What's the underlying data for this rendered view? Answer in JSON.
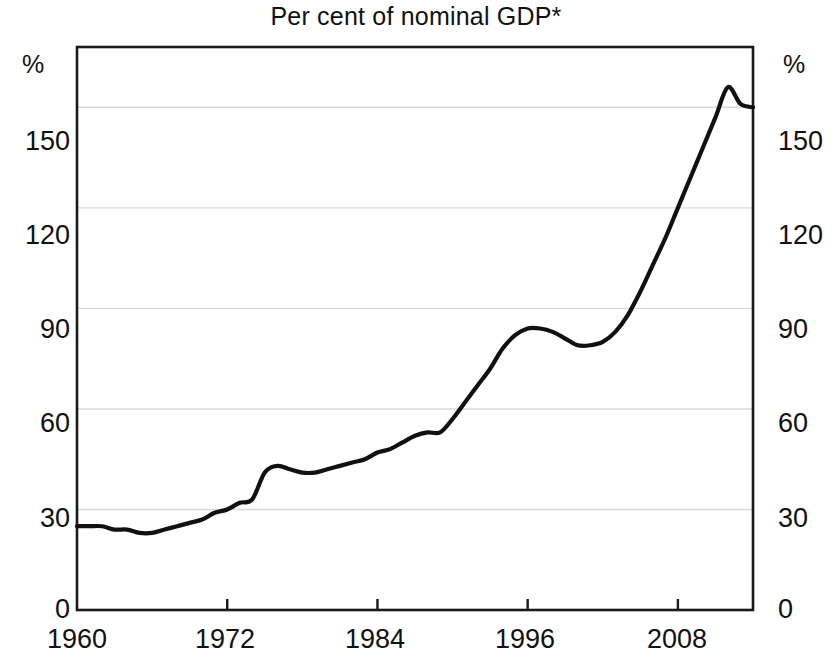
{
  "chart": {
    "title": "Per cent of nominal GDP*",
    "unit_left": "%",
    "unit_right": "%"
  },
  "axis": {
    "y_ticks": [
      "0",
      "30",
      "60",
      "90",
      "120",
      "150"
    ],
    "x_ticks": [
      "1960",
      "1972",
      "1984",
      "1996",
      "2008"
    ]
  },
  "chart_data": {
    "type": "line",
    "title": "Per cent of nominal GDP*",
    "subtitle": "",
    "xlabel": "",
    "ylabel": "%",
    "y_axis_unit": "%",
    "y_axis_unit_right": "%",
    "xlim": [
      1960,
      2014
    ],
    "ylim": [
      0,
      168
    ],
    "y_ticks": [
      0,
      30,
      60,
      90,
      120,
      150
    ],
    "x_ticks": [
      1960,
      1972,
      1984,
      1996,
      2008
    ],
    "grid": "horizontal",
    "legend": "none",
    "line_color": "#111111",
    "annotations": [
      "* asterisk in title denotes footnote"
    ],
    "series": [
      {
        "name": "Per cent of nominal GDP",
        "x": [
          1960,
          1961,
          1962,
          1963,
          1964,
          1965,
          1966,
          1967,
          1968,
          1969,
          1970,
          1971,
          1972,
          1973,
          1974,
          1975,
          1976,
          1977,
          1978,
          1979,
          1980,
          1981,
          1982,
          1983,
          1984,
          1985,
          1986,
          1987,
          1988,
          1989,
          1990,
          1991,
          1992,
          1993,
          1994,
          1995,
          1996,
          1997,
          1998,
          1999,
          2000,
          2001,
          2002,
          2003,
          2004,
          2005,
          2006,
          2007,
          2008,
          2009,
          2010,
          2011,
          2012,
          2013,
          2014
        ],
        "values": [
          25,
          25,
          25,
          24,
          24,
          23,
          23,
          24,
          25,
          26,
          27,
          29,
          30,
          32,
          33,
          41,
          43,
          42,
          41,
          41,
          42,
          43,
          44,
          45,
          47,
          48,
          50,
          52,
          53,
          53,
          57,
          62,
          67,
          72,
          78,
          82,
          84,
          84,
          83,
          81,
          79,
          79,
          80,
          83,
          88,
          95,
          103,
          111,
          120,
          129,
          138,
          147,
          156,
          151,
          150
        ]
      }
    ]
  },
  "geometry": {
    "plot_left": 77,
    "plot_right": 753,
    "plot_top": 47,
    "plot_bottom": 610
  }
}
